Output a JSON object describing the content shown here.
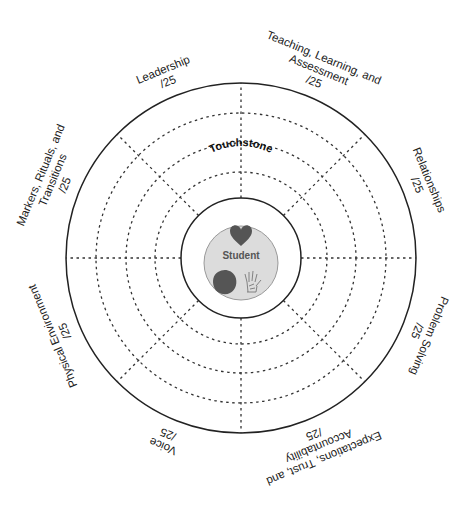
{
  "diagram": {
    "center_title": "Touchstone",
    "center_label": "Student",
    "center_icons": [
      "heart-icon",
      "brain-icon",
      "hand-icon"
    ],
    "rings": {
      "dashed_count": 3,
      "spokes": 8
    },
    "colors": {
      "line": "#222222",
      "center_fill": "#dcdcdc",
      "icon_fill": "#555555"
    },
    "sectors": [
      {
        "name": "Leadership",
        "lines": [
          "Leadership"
        ],
        "score": "/25"
      },
      {
        "name": "Teaching, Learning, and Assessment",
        "lines": [
          "Teaching, Learning, and",
          "Assessment"
        ],
        "score": "/25"
      },
      {
        "name": "Relationships",
        "lines": [
          "Relationships"
        ],
        "score": "/25"
      },
      {
        "name": "Problem Solving",
        "lines": [
          "Problem Solving"
        ],
        "score": "/25"
      },
      {
        "name": "Expectations, Trust, and Accountability",
        "lines": [
          "Expectations, Trust, and",
          "Accountability"
        ],
        "score": "/25"
      },
      {
        "name": "Voice",
        "lines": [
          "Voice"
        ],
        "score": "/25"
      },
      {
        "name": "Physical Environment",
        "lines": [
          "Physical Environment"
        ],
        "score": "/25"
      },
      {
        "name": "Markers, Rituals, and Transitions",
        "lines": [
          "Markers, Rituals, and",
          "Transitions"
        ],
        "score": "/25"
      }
    ]
  }
}
